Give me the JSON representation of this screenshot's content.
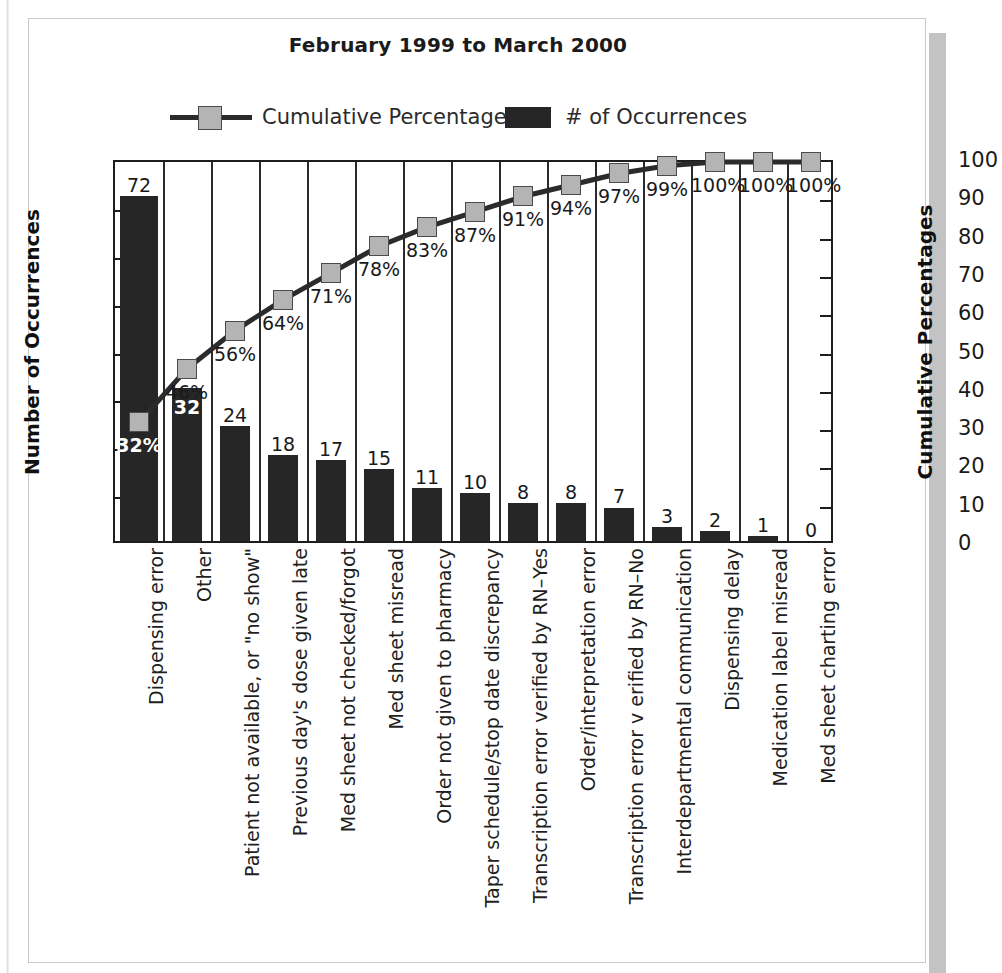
{
  "chart_title": "February 1999 to March 2000",
  "legend": {
    "cumulative_label": "Cumulative Percentage",
    "occurrences_label": "# of Occurrences",
    "marker_color": "#b4b4b4",
    "line_color": "#2b2b2b",
    "bar_color": "#262626"
  },
  "axes": {
    "left_title": "Number of Occurrences",
    "right_title": "Cumulative Percentages",
    "left_ticks": [
      "80",
      "70",
      "60",
      "50",
      "40",
      "30",
      "20",
      "10",
      "0"
    ],
    "right_ticks": [
      "100",
      "90",
      "80",
      "70",
      "60",
      "50",
      "40",
      "30",
      "20",
      "10",
      "0"
    ]
  },
  "chart_data": {
    "type": "bar",
    "title": "February 1999 to March 2000",
    "xlabel": "",
    "ylabel": "Number of Occurrences",
    "y2label": "Cumulative Percentages",
    "ylim": [
      0,
      80
    ],
    "y2lim": [
      0,
      100
    ],
    "grid": true,
    "legend_position": "top",
    "categories": [
      "Dispensing error",
      "Other",
      "Patient not available, or \"no show\"",
      "Previous day's dose given late",
      "Med sheet not checked/forgot",
      "Med sheet misread",
      "Order not given to pharmacy",
      "Taper schedule/stop date discrepancy",
      "Transcription error verified by RN–Yes",
      "Order/interpretation error",
      "Transcription error v erified by RN–No",
      "Interdepartmental communication",
      "Dispensing delay",
      "Medication label misread",
      "Med sheet charting error"
    ],
    "series": [
      {
        "name": "# of Occurrences",
        "axis": "left",
        "type": "bar",
        "values": [
          72,
          32,
          24,
          18,
          17,
          15,
          11,
          10,
          8,
          8,
          7,
          3,
          2,
          1,
          0
        ],
        "labels": [
          "72",
          "32",
          "24",
          "18",
          "17",
          "15",
          "11",
          "10",
          "8",
          "8",
          "7",
          "3",
          "2",
          "1",
          "0"
        ]
      },
      {
        "name": "Cumulative Percentage",
        "axis": "right",
        "type": "line",
        "values": [
          32,
          46,
          56,
          64,
          71,
          78,
          83,
          87,
          91,
          94,
          97,
          99,
          100,
          100,
          100
        ],
        "labels": [
          "32%",
          "46%",
          "56%",
          "64%",
          "71%",
          "78%",
          "83%",
          "87%",
          "91%",
          "94%",
          "97%",
          "99%",
          "100%",
          "100%",
          "100%"
        ]
      }
    ]
  }
}
